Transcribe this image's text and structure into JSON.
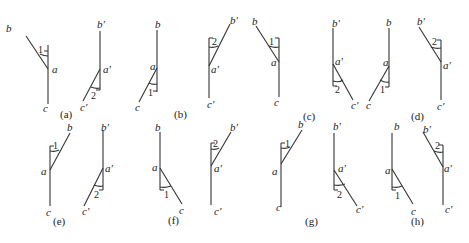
{
  "figure": {
    "panels": [
      {
        "id": "a",
        "caption": "(a)",
        "left": {
          "top": "b",
          "vertex": "a",
          "bottom": "c",
          "angle": "1"
        },
        "right": {
          "top": "b'",
          "vertex": "a'",
          "bottom": "c'",
          "angle": "2"
        }
      },
      {
        "id": "b",
        "caption": "(b)",
        "left": {
          "top": "b",
          "vertex": "a",
          "bottom": "c",
          "angle": "1"
        },
        "right": {
          "top": "b'",
          "vertex": "a'",
          "bottom": "c'",
          "angle": "2"
        }
      },
      {
        "id": "c",
        "caption": "(c)",
        "left": {
          "top": "b",
          "vertex": "a",
          "bottom": "c",
          "angle": "1"
        },
        "right": {
          "top": "b'",
          "vertex": "a'",
          "bottom": "c'",
          "angle": "2"
        }
      },
      {
        "id": "d",
        "caption": "(d)",
        "left": {
          "top": "b",
          "vertex": "a",
          "bottom": "c",
          "angle": "1"
        },
        "right": {
          "top": "b'",
          "vertex": "a'",
          "bottom": "c'",
          "angle": "2"
        }
      },
      {
        "id": "e",
        "caption": "(e)",
        "left": {
          "top": "b",
          "vertex": "a",
          "bottom": "c",
          "angle": "1"
        },
        "right": {
          "top": "b'",
          "vertex": "a'",
          "bottom": "c'",
          "angle": "2"
        }
      },
      {
        "id": "f",
        "caption": "(f)",
        "left": {
          "top": "b",
          "vertex": "a",
          "bottom": "c",
          "angle": "1"
        },
        "right": {
          "top": "b'",
          "vertex": "a'",
          "bottom": "c'",
          "angle": "2"
        }
      },
      {
        "id": "g",
        "caption": "(g)",
        "left": {
          "top": "b",
          "vertex": "a",
          "bottom": "c",
          "angle": "1"
        },
        "right": {
          "top": "b'",
          "vertex": "a'",
          "bottom": "c'",
          "angle": "2"
        }
      },
      {
        "id": "h",
        "caption": "(h)",
        "left": {
          "top": "b",
          "vertex": "a",
          "bottom": "c",
          "angle": "1"
        },
        "right": {
          "top": "b'",
          "vertex": "a'",
          "bottom": "c'",
          "angle": "2"
        }
      }
    ]
  }
}
